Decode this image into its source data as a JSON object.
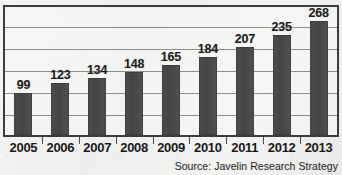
{
  "chart_data": {
    "type": "bar",
    "title": "",
    "subtitle": "",
    "xlabel": "",
    "ylabel": "",
    "categories": [
      "2005",
      "2006",
      "2007",
      "2008",
      "2009",
      "2010",
      "2011",
      "2012",
      "2013"
    ],
    "values": [
      99,
      123,
      134,
      148,
      165,
      184,
      207,
      235,
      268
    ],
    "data_labels": [
      "99",
      "123",
      "134",
      "148",
      "165",
      "184",
      "207",
      "235",
      "268"
    ],
    "ylim": [
      0,
      302
    ],
    "grid": true,
    "gridlines": [
      302,
      252,
      202,
      151,
      101,
      50,
      0
    ],
    "legend": null,
    "legend_position": "none",
    "annotations": [
      "Source: Javelin Research Strategy"
    ],
    "bar_color": "#4a4a4a",
    "frame_color": "#3c3c3c",
    "gridline_color": "#8e8e8e",
    "background_color": "#f2f2f0"
  },
  "footer": {
    "source_note": "Source: Javelin Research Strategy"
  }
}
